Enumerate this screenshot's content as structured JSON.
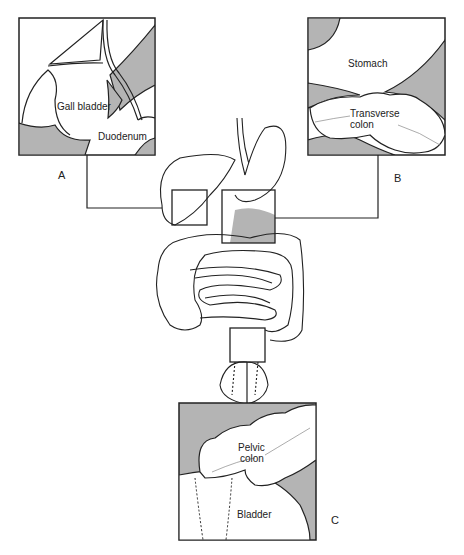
{
  "diagram": {
    "panels": [
      {
        "id": "A",
        "letter": "A",
        "labels": [
          "Gall bladder",
          "Duodenum"
        ]
      },
      {
        "id": "B",
        "letter": "B",
        "labels": [
          "Stomach",
          "Transverse",
          "colon"
        ]
      },
      {
        "id": "C",
        "letter": "C",
        "labels": [
          "Pelvic",
          "colon",
          "Bladder"
        ]
      }
    ],
    "colors": {
      "gray": "#b4b4b4",
      "line": "#222222",
      "bg": "#ffffff"
    }
  }
}
